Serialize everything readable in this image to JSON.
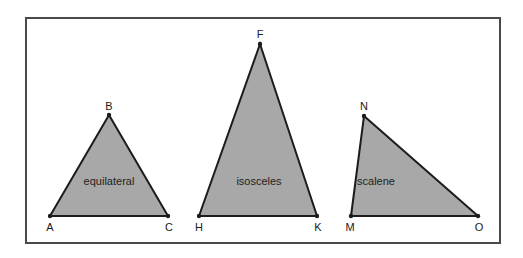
{
  "diagram": {
    "colors": {
      "frame": "#4a4a4a",
      "fill": "#a8a8a8",
      "stroke": "#1c1c1c",
      "text": "#222222",
      "background": "#ffffff"
    },
    "triangles": [
      {
        "type_label": "equilateral",
        "vertices": [
          {
            "name": "A",
            "x": 50,
            "y": 216
          },
          {
            "name": "B",
            "x": 109,
            "y": 115
          },
          {
            "name": "C",
            "x": 168,
            "y": 216
          }
        ]
      },
      {
        "type_label": "isosceles",
        "vertices": [
          {
            "name": "H",
            "x": 199,
            "y": 216
          },
          {
            "name": "F",
            "x": 260,
            "y": 44
          },
          {
            "name": "K",
            "x": 317,
            "y": 216
          }
        ]
      },
      {
        "type_label": "scalene",
        "vertices": [
          {
            "name": "M",
            "x": 351,
            "y": 216
          },
          {
            "name": "N",
            "x": 364,
            "y": 116
          },
          {
            "name": "O",
            "x": 478,
            "y": 216
          }
        ]
      }
    ]
  }
}
